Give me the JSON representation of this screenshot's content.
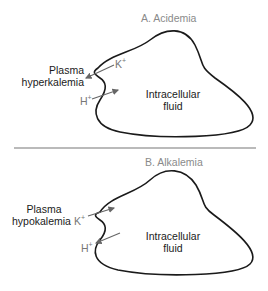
{
  "panel_a": {
    "title": "A. Acidemia",
    "plasma_label_line1": "Plasma",
    "plasma_label_line2": "hyperkalemia",
    "ion_k": "K",
    "ion_k_charge": "+",
    "ion_h": "H",
    "ion_h_charge": "+",
    "cell_label_line1": "Intracellular",
    "cell_label_line2": "fluid"
  },
  "panel_b": {
    "title": "B. Alkalemia",
    "plasma_label_line1": "Plasma",
    "plasma_label_line2": "hypokalemia",
    "ion_k": "K",
    "ion_k_charge": "+",
    "ion_h": "H",
    "ion_h_charge": "+",
    "cell_label_line1": "Intracellular",
    "cell_label_line2": "fluid"
  },
  "colors": {
    "outline": "#1a1a1a",
    "arrow": "#666666",
    "title": "#8a8a8a",
    "divider": "#777777"
  }
}
